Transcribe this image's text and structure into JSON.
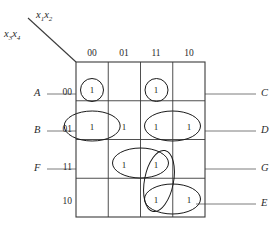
{
  "figure": {
    "type": "karnaugh-map",
    "title": "",
    "variable_labels": {
      "columns": "x1x2",
      "columns_base": "x",
      "columns_sub_1": "1",
      "columns_sub_2": "2",
      "rows": "x3x4",
      "rows_base": "x",
      "rows_sub_1": "3",
      "rows_sub_2": "4"
    },
    "column_headers": [
      "00",
      "01",
      "11",
      "10"
    ],
    "row_headers": [
      "00",
      "01",
      "11",
      "10"
    ],
    "cells": [
      [
        "1",
        "",
        "1",
        ""
      ],
      [
        "1",
        "1",
        "1",
        "1"
      ],
      [
        "",
        "1",
        "1",
        ""
      ],
      [
        "",
        "",
        "1",
        "1"
      ]
    ],
    "group_labels_left": [
      "A",
      "B",
      "F"
    ],
    "group_labels_right": [
      "C",
      "D",
      "G",
      "E"
    ],
    "groups": [
      {
        "label": "A",
        "cells": "row00-col00",
        "shape": "circle",
        "side": "left"
      },
      {
        "label": "C",
        "cells": "row00-col11",
        "shape": "circle",
        "side": "right"
      },
      {
        "label": "B",
        "cells": "row01-col00,row01-col01",
        "shape": "ellipse-h",
        "side": "left"
      },
      {
        "label": "D",
        "cells": "row01-col11,row01-col10",
        "shape": "ellipse-h",
        "side": "right"
      },
      {
        "label": "F",
        "cells": "row11-col01,row11-col11",
        "shape": "ellipse-h",
        "side": "left"
      },
      {
        "label": "G",
        "cells": "row11-col11,row10-col11",
        "shape": "ellipse-v-tilted",
        "side": "right"
      },
      {
        "label": "E",
        "cells": "row10-col11,row10-col10",
        "shape": "ellipse-h",
        "side": "right"
      }
    ],
    "colors": {
      "grid": "#3b3b3b",
      "leader": "#6e6e6e",
      "group": "#1a1a1a",
      "text": "#2b2b2b",
      "background": "#ffffff"
    }
  }
}
